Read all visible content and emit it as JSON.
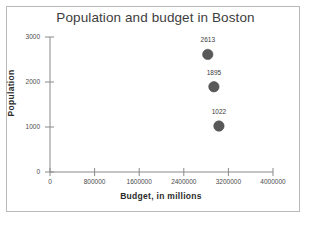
{
  "chart_data": {
    "type": "scatter",
    "title": "Population and budget in Boston",
    "xlabel": "Budget, in millions",
    "ylabel": "Population",
    "xlim": [
      0,
      4000000
    ],
    "ylim": [
      0,
      3000
    ],
    "grid": false,
    "legend": null,
    "marker_color": "#595959",
    "xticks": [
      "0",
      "800000",
      "1600000",
      "2400000",
      "3200000",
      "4000000"
    ],
    "xtick_values": [
      0,
      800000,
      1600000,
      2400000,
      3200000,
      4000000
    ],
    "yticks": [
      "0",
      "1000",
      "2000",
      "3000"
    ],
    "ytick_values": [
      0,
      1000,
      2000,
      3000
    ],
    "points": [
      {
        "label": "2613",
        "x": 2830000,
        "y": 2613
      },
      {
        "label": "1895",
        "x": 2940000,
        "y": 1895
      },
      {
        "label": "1022",
        "x": 3030000,
        "y": 1022
      }
    ]
  }
}
